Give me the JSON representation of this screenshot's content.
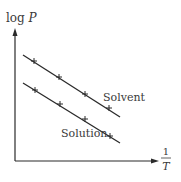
{
  "diagram": {
    "y_axis_label": {
      "prefix": "log ",
      "var": "P"
    },
    "x_axis_label": {
      "numerator": "1",
      "denominator": "T"
    },
    "lines": [
      {
        "name": "Solvent",
        "label": "Solvent"
      },
      {
        "name": "Solution",
        "label": "Solution"
      }
    ],
    "colors": {
      "ink": "#2a2a2a",
      "background": "#ffffff"
    }
  }
}
